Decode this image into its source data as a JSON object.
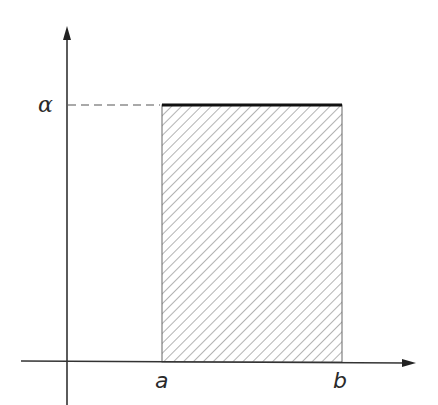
{
  "diagram": {
    "type": "uniform-distribution-density",
    "labels": {
      "y_level": "α",
      "x_start": "a",
      "x_end": "b"
    },
    "colors": {
      "axis": "#333333",
      "hatch": "#8a8a8a",
      "top_edge": "#111111",
      "outline": "#666666",
      "dash": "#555555",
      "background": "#ffffff"
    },
    "elements": {
      "x_axis": "horizontal axis with arrow pointing right",
      "y_axis": "vertical axis with arrow pointing up",
      "rectangle": "hatched rectangle from a to b, height α",
      "dashed_guide": "dashed line from y-axis at α to rectangle top-left corner",
      "top_edge": "thick line along top of rectangle at height α"
    }
  }
}
